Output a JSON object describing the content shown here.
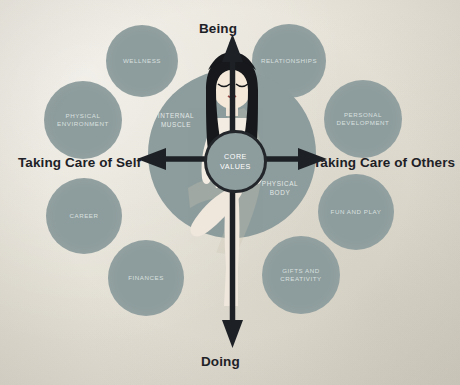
{
  "diagram": {
    "background_color": "#e8e4da",
    "circle_color": "#8d9c9c",
    "axis_color": "#1d2126",
    "axes": {
      "top_label": "Being",
      "bottom_label": "Doing",
      "left_label": "Taking Care of Self",
      "right_label": "Taking Care of Others"
    },
    "hub": {
      "line1": "CORE",
      "line2": "VALUES"
    },
    "quadrant_labels": [
      {
        "id": "internal-muscle",
        "line1": "INTERNAL",
        "line2": "MUSCLE"
      },
      {
        "id": "physical-body",
        "line1": "PHYSICAL",
        "line2": "BODY"
      }
    ],
    "satellites": [
      {
        "id": "wellness",
        "line1": "WELLNESS",
        "line2": "",
        "x": 106,
        "y": 25,
        "size": 72
      },
      {
        "id": "relationships",
        "line1": "RELATIONSHIPS",
        "line2": "",
        "x": 252,
        "y": 24,
        "size": 74
      },
      {
        "id": "physical-environment",
        "line1": "PHYSICAL",
        "line2": "ENVIRONMENT",
        "x": 44,
        "y": 81,
        "size": 78
      },
      {
        "id": "personal-development",
        "line1": "PERSONAL",
        "line2": "DEVELOPMENT",
        "x": 324,
        "y": 80,
        "size": 78
      },
      {
        "id": "career",
        "line1": "CAREER",
        "line2": "",
        "x": 46,
        "y": 178,
        "size": 76
      },
      {
        "id": "fun-and-play",
        "line1": "FUN and PLAY",
        "line2": "",
        "x": 318,
        "y": 174,
        "size": 76
      },
      {
        "id": "finances",
        "line1": "FINANCES",
        "line2": "",
        "x": 108,
        "y": 240,
        "size": 76
      },
      {
        "id": "gifts-and-creativity",
        "line1": "GIFTS and",
        "line2": "CREATIVITY",
        "x": 262,
        "y": 236,
        "size": 78
      }
    ]
  }
}
